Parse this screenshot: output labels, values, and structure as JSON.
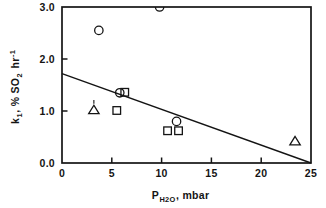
{
  "chart_data": {
    "type": "scatter",
    "title": "",
    "xlabel": "P_H2O, mbar",
    "xlabel_base": "P",
    "xlabel_sub": "H",
    "xlabel_sub2": "2",
    "xlabel_sub3": "O",
    "xlabel_tail": ", mbar",
    "ylabel": "k_1, % SO_2 hr^-1",
    "ylabel_base": "k",
    "ylabel_sub": "1",
    "ylabel_mid": ", % SO",
    "ylabel_sub2": "2",
    "ylabel_mid2": " hr",
    "ylabel_sup": "-1",
    "xlim": [
      0,
      25
    ],
    "ylim": [
      0.0,
      3.0
    ],
    "xticks": [
      0,
      5,
      10,
      15,
      20,
      25
    ],
    "xtick_labels": [
      "0",
      "5",
      "10",
      "15",
      "20",
      "25"
    ],
    "yticks": [
      0.0,
      1.0,
      2.0,
      3.0
    ],
    "ytick_labels": [
      "0.0",
      "1.0",
      "2.0",
      "3.0"
    ],
    "grid": false,
    "legend": "none",
    "frame": "box",
    "series": [
      {
        "name": "circles",
        "marker": "circle",
        "points": [
          {
            "x": 3.7,
            "y": 2.55
          },
          {
            "x": 9.8,
            "y": 3.0
          },
          {
            "x": 5.8,
            "y": 1.35
          },
          {
            "x": 11.5,
            "y": 0.8
          }
        ]
      },
      {
        "name": "squares",
        "marker": "square",
        "points": [
          {
            "x": 6.3,
            "y": 1.36
          },
          {
            "x": 5.5,
            "y": 1.01
          },
          {
            "x": 10.6,
            "y": 0.62
          },
          {
            "x": 11.7,
            "y": 0.62
          }
        ]
      },
      {
        "name": "triangles",
        "marker": "triangle",
        "points": [
          {
            "x": 3.2,
            "y": 1.02
          },
          {
            "x": 23.4,
            "y": 0.42
          }
        ]
      }
    ],
    "trend_line": {
      "name": "fit-line",
      "x_start": 0,
      "y_start": 1.72,
      "x_end": 25,
      "y_end": 0.0
    },
    "colors": {
      "axis": "#141414",
      "marker": "#141414",
      "line": "#141414",
      "background": "#ffffff"
    }
  }
}
